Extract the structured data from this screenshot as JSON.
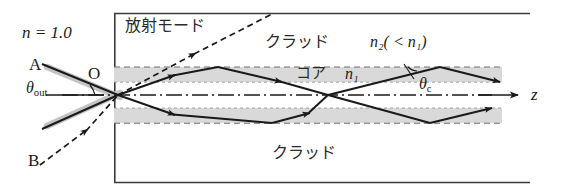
{
  "figure": {
    "colors": {
      "line": "#1a1a1a",
      "band_fill": "#d9d9d9",
      "band_dash": "#6b6b6b",
      "glow": "#bcbcbc",
      "text": "#1a1a1a"
    }
  },
  "labels": {
    "outside_index": "n = 1.0",
    "radiation_mode": "放射モード",
    "cladding_top": "クラッド",
    "cladding_index": "n₂( < n₁)",
    "core": "コア",
    "core_index": "n₁",
    "cladding_bottom": "クラッド",
    "point_o": "O",
    "ray_a": "A",
    "ray_b": "B",
    "theta_out": "θ",
    "theta_out_sub": "out",
    "theta_c": "θ",
    "theta_c_sub": "c",
    "axis_z": "z"
  },
  "geometry": {
    "frame": {
      "left": 114,
      "top": 13,
      "right": 530,
      "bottom": 183
    },
    "core": {
      "left": 114,
      "right": 502,
      "top": 67,
      "bottom": 123,
      "axis_y": 95
    },
    "band_thickness": 15,
    "origin": {
      "x": 118,
      "y": 95
    },
    "upper_vertices_x": [
      218,
      440
    ],
    "lower_vertices_x": [
      272,
      492
    ],
    "radiation_ray_end": {
      "x": 272,
      "y": 15
    },
    "z_arrow_end": {
      "x": 518,
      "y": 95
    }
  }
}
